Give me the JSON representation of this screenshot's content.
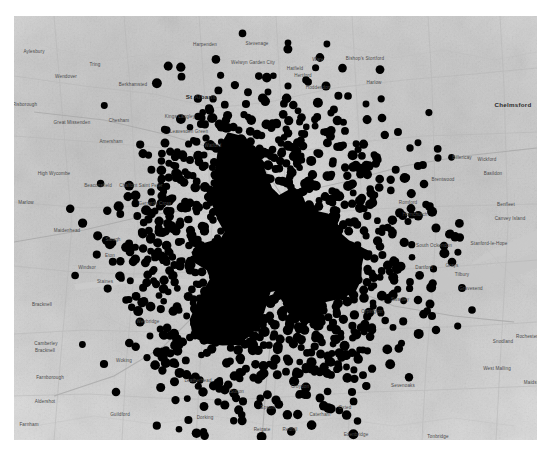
{
  "figure": {
    "kind": "scatter-map",
    "background_color": "#ffffff",
    "map_background_color": "#e6e6e6",
    "point_color": "#000000",
    "water_color": "#c8c8c8",
    "road_color": "#bdbdbd",
    "label_color": "#4a4a4a",
    "panel": {
      "left": 14,
      "top": 16,
      "width": 523,
      "height": 424
    }
  },
  "chart_data": {
    "type": "scatter",
    "title": "",
    "xlabel": "",
    "ylabel": "",
    "grid": false,
    "legend": null,
    "basemap": "greyscale street map, Greater London and South East England",
    "marker": {
      "shape": "circle",
      "color": "#000000",
      "diameter_px": 8,
      "opacity": 1.0
    },
    "cluster_center_px": [
      268,
      252
    ],
    "cluster_radius_px": 150,
    "approx_point_count": 3800,
    "density_profile": [
      {
        "radius_px": 0,
        "relative_density": 1.0
      },
      {
        "radius_px": 40,
        "relative_density": 1.0
      },
      {
        "radius_px": 80,
        "relative_density": 0.92
      },
      {
        "radius_px": 110,
        "relative_density": 0.62
      },
      {
        "radius_px": 140,
        "relative_density": 0.26
      },
      {
        "radius_px": 175,
        "relative_density": 0.07
      },
      {
        "radius_px": 215,
        "relative_density": 0.01
      }
    ]
  },
  "labels": {
    "major": [
      {
        "name": "St Albans",
        "x": 201,
        "y": 97
      },
      {
        "name": "Chelmsford",
        "x": 513,
        "y": 105
      }
    ],
    "places": [
      {
        "name": "Aylesbury",
        "x": 34,
        "y": 52
      },
      {
        "name": "Tring",
        "x": 95,
        "y": 65
      },
      {
        "name": "Wendover",
        "x": 66,
        "y": 77
      },
      {
        "name": "Berkhamsted",
        "x": 133,
        "y": 85
      },
      {
        "name": "Harpenden",
        "x": 205,
        "y": 45
      },
      {
        "name": "Stevenage",
        "x": 257,
        "y": 44
      },
      {
        "name": "Welwyn Garden City",
        "x": 253,
        "y": 62
      },
      {
        "name": "Hatfield",
        "x": 295,
        "y": 69
      },
      {
        "name": "Ware",
        "x": 318,
        "y": 60
      },
      {
        "name": "Hertford",
        "x": 303,
        "y": 76
      },
      {
        "name": "Hoddesdon",
        "x": 318,
        "y": 88
      },
      {
        "name": "Bishop's Stortford",
        "x": 365,
        "y": 58
      },
      {
        "name": "Harlow",
        "x": 374,
        "y": 83
      },
      {
        "name": "Princes Risborough",
        "x": 16,
        "y": 104
      },
      {
        "name": "Great Missenden",
        "x": 72,
        "y": 122
      },
      {
        "name": "Chesham",
        "x": 119,
        "y": 121
      },
      {
        "name": "Kings Langley",
        "x": 180,
        "y": 116
      },
      {
        "name": "Leavesden Green",
        "x": 189,
        "y": 131
      },
      {
        "name": "Amersham",
        "x": 111,
        "y": 142
      },
      {
        "name": "Watford",
        "x": 213,
        "y": 146
      },
      {
        "name": "High Wycombe",
        "x": 54,
        "y": 173
      },
      {
        "name": "Beaconsfield",
        "x": 98,
        "y": 185
      },
      {
        "name": "Chalfont Saint Peter",
        "x": 141,
        "y": 185
      },
      {
        "name": "Gerrards Cross",
        "x": 155,
        "y": 203
      },
      {
        "name": "Marlow",
        "x": 26,
        "y": 203
      },
      {
        "name": "Maidenhead",
        "x": 67,
        "y": 231
      },
      {
        "name": "Slough",
        "x": 113,
        "y": 240
      },
      {
        "name": "Eton",
        "x": 110,
        "y": 256
      },
      {
        "name": "Windsor",
        "x": 87,
        "y": 268
      },
      {
        "name": "Bracknell",
        "x": 42,
        "y": 305
      },
      {
        "name": "Staines",
        "x": 105,
        "y": 282
      },
      {
        "name": "Weybridge",
        "x": 148,
        "y": 322
      },
      {
        "name": "Camberley",
        "x": 46,
        "y": 344
      },
      {
        "name": "Bracknell ",
        "x": 45,
        "y": 351
      },
      {
        "name": "Woking",
        "x": 124,
        "y": 361
      },
      {
        "name": "Leatherhead",
        "x": 198,
        "y": 381
      },
      {
        "name": "Farnborough",
        "x": 50,
        "y": 378
      },
      {
        "name": "Aldershot",
        "x": 45,
        "y": 402
      },
      {
        "name": "Guildford",
        "x": 120,
        "y": 415
      },
      {
        "name": "Dorking",
        "x": 205,
        "y": 418
      },
      {
        "name": "Farnham",
        "x": 29,
        "y": 425
      },
      {
        "name": "Godalming",
        "x": 104,
        "y": 443
      },
      {
        "name": "Epsom",
        "x": 268,
        "y": 408
      },
      {
        "name": "Croydon",
        "x": 300,
        "y": 387
      },
      {
        "name": "Sutton",
        "x": 237,
        "y": 392
      },
      {
        "name": "Redhill",
        "x": 290,
        "y": 430
      },
      {
        "name": "Reigate",
        "x": 262,
        "y": 430
      },
      {
        "name": "Brentwood",
        "x": 443,
        "y": 180
      },
      {
        "name": "Basildon",
        "x": 493,
        "y": 174
      },
      {
        "name": "Wickford",
        "x": 487,
        "y": 160
      },
      {
        "name": "Billericay",
        "x": 462,
        "y": 158
      },
      {
        "name": "Romford",
        "x": 408,
        "y": 203
      },
      {
        "name": "Hornchurch",
        "x": 415,
        "y": 215
      },
      {
        "name": "Benfleet",
        "x": 506,
        "y": 205
      },
      {
        "name": "Canvey Island",
        "x": 510,
        "y": 218
      },
      {
        "name": "South Ockendon",
        "x": 434,
        "y": 245
      },
      {
        "name": "Stanford-le-Hope",
        "x": 489,
        "y": 243
      },
      {
        "name": "Grays",
        "x": 452,
        "y": 266
      },
      {
        "name": "Tilbury",
        "x": 462,
        "y": 275
      },
      {
        "name": "Gravesend",
        "x": 471,
        "y": 289
      },
      {
        "name": "Dartford",
        "x": 424,
        "y": 268
      },
      {
        "name": "Swanley",
        "x": 400,
        "y": 300
      },
      {
        "name": "Orpington",
        "x": 372,
        "y": 312
      },
      {
        "name": "Snodland",
        "x": 503,
        "y": 342
      },
      {
        "name": "Rochester",
        "x": 527,
        "y": 337
      },
      {
        "name": "West Malling",
        "x": 497,
        "y": 368
      },
      {
        "name": "Maidstone",
        "x": 535,
        "y": 383
      },
      {
        "name": "Sevenoaks",
        "x": 403,
        "y": 386
      },
      {
        "name": "Tonbridge",
        "x": 438,
        "y": 437
      },
      {
        "name": "Tunbridge Wells",
        "x": 475,
        "y": 447
      },
      {
        "name": "Edenbridge",
        "x": 356,
        "y": 435
      },
      {
        "name": "Caterham",
        "x": 320,
        "y": 415
      },
      {
        "name": "Oxted",
        "x": 345,
        "y": 408
      }
    ]
  }
}
